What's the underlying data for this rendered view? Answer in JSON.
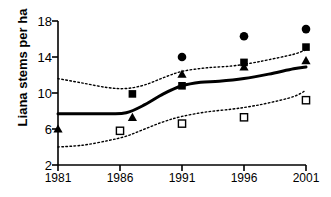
{
  "chart_data": {
    "type": "scatter",
    "title": "",
    "xlabel": "",
    "ylabel": "Liana stems per ha",
    "xlim": [
      1981,
      2001
    ],
    "ylim": [
      2,
      18
    ],
    "ytick_labels": [
      "18",
      "14",
      "10",
      "6",
      "2"
    ],
    "yticks": [
      18,
      14,
      10,
      6,
      2
    ],
    "xtick_labels": [
      "1981",
      "1986",
      "1991",
      "1996",
      "2001"
    ],
    "xticks": [
      1981,
      1986,
      1991,
      1996,
      2001
    ],
    "grid": false,
    "legend": "none",
    "x": [
      1981,
      1986,
      1991,
      1996,
      2001
    ],
    "series": [
      {
        "name": "filled-circle",
        "marker": "filled-circle",
        "color": "#000000",
        "points": [
          {
            "x": 1991,
            "y": 14.0
          },
          {
            "x": 1996,
            "y": 16.3
          },
          {
            "x": 2001,
            "y": 17.1
          }
        ]
      },
      {
        "name": "filled-square",
        "marker": "filled-square",
        "color": "#000000",
        "points": [
          {
            "x": 1987,
            "y": 9.9
          },
          {
            "x": 1991,
            "y": 10.8
          },
          {
            "x": 1996,
            "y": 13.4
          },
          {
            "x": 2001,
            "y": 15.1
          }
        ]
      },
      {
        "name": "filled-triangle",
        "marker": "filled-triangle",
        "color": "#000000",
        "points": [
          {
            "x": 1981,
            "y": 6.0
          },
          {
            "x": 1987,
            "y": 7.3
          },
          {
            "x": 1991,
            "y": 12.1
          },
          {
            "x": 1996,
            "y": 12.9
          },
          {
            "x": 2001,
            "y": 13.6
          }
        ]
      },
      {
        "name": "open-square",
        "marker": "open-square",
        "color": "#000000",
        "points": [
          {
            "x": 1986,
            "y": 5.8
          },
          {
            "x": 1991,
            "y": 6.6
          },
          {
            "x": 1996,
            "y": 7.3
          },
          {
            "x": 2001,
            "y": 9.2
          }
        ]
      }
    ],
    "fit_line": {
      "name": "fitted-trend",
      "style": "solid",
      "color": "#000000",
      "values": [
        {
          "x": 1981.0,
          "y": 7.7
        },
        {
          "x": 1983.0,
          "y": 7.7
        },
        {
          "x": 1985.0,
          "y": 7.7
        },
        {
          "x": 1986.5,
          "y": 7.8
        },
        {
          "x": 1988.0,
          "y": 8.7
        },
        {
          "x": 1989.5,
          "y": 9.9
        },
        {
          "x": 1991.0,
          "y": 10.8
        },
        {
          "x": 1992.5,
          "y": 11.2
        },
        {
          "x": 1994.0,
          "y": 11.3
        },
        {
          "x": 1996.0,
          "y": 11.6
        },
        {
          "x": 1998.0,
          "y": 12.1
        },
        {
          "x": 2000.0,
          "y": 12.7
        },
        {
          "x": 2001.0,
          "y": 12.9
        }
      ]
    },
    "confidence_bands": [
      {
        "name": "upper-confidence-limit",
        "style": "dotted",
        "color": "#000000",
        "values": [
          {
            "x": 1981.0,
            "y": 11.6
          },
          {
            "x": 1983.0,
            "y": 11.1
          },
          {
            "x": 1985.0,
            "y": 10.6
          },
          {
            "x": 1986.5,
            "y": 10.5
          },
          {
            "x": 1988.0,
            "y": 10.9
          },
          {
            "x": 1989.5,
            "y": 11.7
          },
          {
            "x": 1991.0,
            "y": 12.4
          },
          {
            "x": 1993.0,
            "y": 12.8
          },
          {
            "x": 1995.0,
            "y": 13.0
          },
          {
            "x": 1996.5,
            "y": 13.3
          },
          {
            "x": 1998.0,
            "y": 13.7
          },
          {
            "x": 2000.0,
            "y": 14.3
          },
          {
            "x": 2001.0,
            "y": 14.8
          }
        ]
      },
      {
        "name": "lower-confidence-limit",
        "style": "dotted",
        "color": "#000000",
        "values": [
          {
            "x": 1981.0,
            "y": 4.0
          },
          {
            "x": 1983.0,
            "y": 4.2
          },
          {
            "x": 1985.0,
            "y": 4.7
          },
          {
            "x": 1986.5,
            "y": 5.2
          },
          {
            "x": 1988.0,
            "y": 6.0
          },
          {
            "x": 1989.5,
            "y": 6.8
          },
          {
            "x": 1991.0,
            "y": 7.4
          },
          {
            "x": 1993.0,
            "y": 7.9
          },
          {
            "x": 1995.0,
            "y": 8.2
          },
          {
            "x": 1996.5,
            "y": 8.5
          },
          {
            "x": 1998.0,
            "y": 8.9
          },
          {
            "x": 2000.0,
            "y": 9.6
          },
          {
            "x": 2001.0,
            "y": 10.3
          }
        ]
      }
    ]
  },
  "axes": {
    "y_title": "Liana stems per ha",
    "y_ticks": [
      {
        "label": "18",
        "value": 18
      },
      {
        "label": "14",
        "value": 14
      },
      {
        "label": "10",
        "value": 10
      },
      {
        "label": "6",
        "value": 6
      },
      {
        "label": "2",
        "value": 2
      }
    ],
    "x_ticks": [
      {
        "label": "1981",
        "value": 1981
      },
      {
        "label": "1986",
        "value": 1986
      },
      {
        "label": "1991",
        "value": 1991
      },
      {
        "label": "1996",
        "value": 1996
      },
      {
        "label": "2001",
        "value": 2001
      }
    ]
  }
}
